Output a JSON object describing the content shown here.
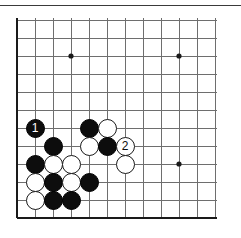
{
  "figure": {
    "kind": "go-board",
    "board_size": 19,
    "view": "bottom-left corner section",
    "colors": {
      "background": "#ffffff",
      "grid_line": "#6e6e6e",
      "grid_line_major": "#3a3a3a",
      "board_edge": "#1a1a1a",
      "black_stone": "#0d0d0d",
      "white_stone": "#ffffff",
      "stone_outline": "#1a1a1a",
      "top_rule": "#3a3a3a"
    }
  },
  "board": {
    "origin_x": 17,
    "origin_y": 20,
    "cell": 18,
    "cols": 12,
    "rows": 12,
    "edge_left_col": 0,
    "edge_bottom_row": 11,
    "star_points": [
      {
        "col": 3,
        "row": 2
      },
      {
        "col": 9,
        "row": 2
      },
      {
        "col": 9,
        "row": 8
      }
    ],
    "star_radius": 2.6
  },
  "stones": [
    {
      "col": 1,
      "row": 6,
      "color": "black",
      "label": "1",
      "move_number": 1
    },
    {
      "col": 4,
      "row": 6,
      "color": "black",
      "label": ""
    },
    {
      "col": 5,
      "row": 6,
      "color": "white",
      "label": ""
    },
    {
      "col": 4,
      "row": 7,
      "color": "white",
      "label": ""
    },
    {
      "col": 5,
      "row": 7,
      "color": "black",
      "label": ""
    },
    {
      "col": 6,
      "row": 7,
      "color": "white",
      "label": "2",
      "move_number": 2
    },
    {
      "col": 2,
      "row": 7,
      "color": "black",
      "label": ""
    },
    {
      "col": 1,
      "row": 8,
      "color": "black",
      "label": ""
    },
    {
      "col": 2,
      "row": 8,
      "color": "white",
      "label": ""
    },
    {
      "col": 3,
      "row": 8,
      "color": "white",
      "label": ""
    },
    {
      "col": 6,
      "row": 8,
      "color": "white",
      "label": ""
    },
    {
      "col": 1,
      "row": 9,
      "color": "white",
      "label": ""
    },
    {
      "col": 2,
      "row": 9,
      "color": "black",
      "label": ""
    },
    {
      "col": 3,
      "row": 9,
      "color": "white",
      "label": ""
    },
    {
      "col": 4,
      "row": 9,
      "color": "black",
      "label": ""
    },
    {
      "col": 1,
      "row": 10,
      "color": "white",
      "label": ""
    },
    {
      "col": 2,
      "row": 10,
      "color": "black",
      "label": ""
    },
    {
      "col": 3,
      "row": 10,
      "color": "black",
      "label": ""
    }
  ]
}
